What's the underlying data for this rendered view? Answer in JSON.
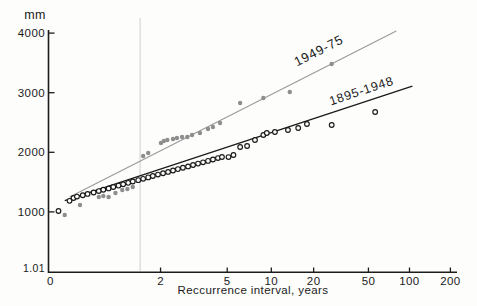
{
  "figure": {
    "unit_label": "mm",
    "x_axis_title": "Reccurrence interval, years"
  },
  "chart_data": {
    "type": "scatter",
    "title": "",
    "xlabel": "Reccurrence interval, years",
    "ylabel": "mm",
    "x_scale": "gumbel-probability (recurrence interval, log-like)",
    "y_scale": "linear",
    "xlim_T": [
      1.01,
      230
    ],
    "ylim_mm": [
      0,
      4100
    ],
    "grid": false,
    "x_ticks": [
      2,
      5,
      10,
      20,
      50,
      100,
      200
    ],
    "x_origin_label": "0",
    "y_ticks": [
      4000,
      3000,
      2000,
      1000
    ],
    "y_bottom_label": "1.01",
    "faint_line_T": 1.6,
    "colors": {
      "axis": "#1c1c1c",
      "background": "#fdfdfc",
      "faint_gridline": "#dcdcdc",
      "series_1949_75": "#8e8e8e",
      "series_1949_75_line": "#9a9a9a",
      "series_1895_1948": "#1a1a1a"
    },
    "series": [
      {
        "name": "1949-75",
        "marker": "filled-circle",
        "color": "#8e8e8e",
        "line_color": "#9a9a9a",
        "trend_T_mm": [
          [
            1.04,
            1250
          ],
          [
            80,
            4035
          ]
        ],
        "points_T_mm": [
          [
            1.03,
            948
          ],
          [
            1.07,
            1116
          ],
          [
            1.16,
            1250
          ],
          [
            1.19,
            1267
          ],
          [
            1.23,
            1250
          ],
          [
            1.29,
            1317
          ],
          [
            1.36,
            1368
          ],
          [
            1.42,
            1384
          ],
          [
            1.49,
            1418
          ],
          [
            1.65,
            1938
          ],
          [
            1.74,
            1988
          ],
          [
            2.01,
            2156
          ],
          [
            2.08,
            2189
          ],
          [
            2.17,
            2206
          ],
          [
            2.33,
            2223
          ],
          [
            2.45,
            2240
          ],
          [
            2.62,
            2257
          ],
          [
            2.81,
            2257
          ],
          [
            3.0,
            2290
          ],
          [
            3.35,
            2324
          ],
          [
            3.76,
            2391
          ],
          [
            4.04,
            2424
          ],
          [
            4.49,
            2492
          ],
          [
            6.1,
            2827
          ],
          [
            8.8,
            2911
          ],
          [
            13.5,
            3012
          ],
          [
            27,
            3481
          ]
        ]
      },
      {
        "name": "1895-1948",
        "marker": "open-circle",
        "color": "#1a1a1a",
        "line_color": "#1a1a1a",
        "trend_T_mm": [
          [
            1.03,
            1190
          ],
          [
            105,
            3112
          ]
        ],
        "points_T_mm": [
          [
            1.02,
            1015
          ],
          [
            1.04,
            1185
          ],
          [
            1.05,
            1233
          ],
          [
            1.06,
            1257
          ],
          [
            1.08,
            1279
          ],
          [
            1.1,
            1302
          ],
          [
            1.13,
            1325
          ],
          [
            1.16,
            1349
          ],
          [
            1.19,
            1371
          ],
          [
            1.23,
            1394
          ],
          [
            1.27,
            1418
          ],
          [
            1.32,
            1441
          ],
          [
            1.37,
            1463
          ],
          [
            1.43,
            1487
          ],
          [
            1.49,
            1510
          ],
          [
            1.57,
            1533
          ],
          [
            1.65,
            1555
          ],
          [
            1.74,
            1579
          ],
          [
            1.83,
            1602
          ],
          [
            1.94,
            1626
          ],
          [
            2.06,
            1648
          ],
          [
            2.19,
            1671
          ],
          [
            2.33,
            1695
          ],
          [
            2.48,
            1718
          ],
          [
            2.65,
            1740
          ],
          [
            2.84,
            1763
          ],
          [
            3.04,
            1787
          ],
          [
            3.26,
            1810
          ],
          [
            3.5,
            1832
          ],
          [
            3.76,
            1856
          ],
          [
            4.04,
            1879
          ],
          [
            4.35,
            1903
          ],
          [
            4.62,
            1921
          ],
          [
            5.1,
            1920
          ],
          [
            5.5,
            1955
          ],
          [
            6.1,
            2089
          ],
          [
            6.8,
            2106
          ],
          [
            7.7,
            2206
          ],
          [
            8.8,
            2290
          ],
          [
            9.3,
            2324
          ],
          [
            10.6,
            2340
          ],
          [
            13.1,
            2374
          ],
          [
            15.5,
            2408
          ],
          [
            17.9,
            2475
          ],
          [
            27,
            2458
          ],
          [
            56,
            2676
          ]
        ]
      }
    ]
  }
}
